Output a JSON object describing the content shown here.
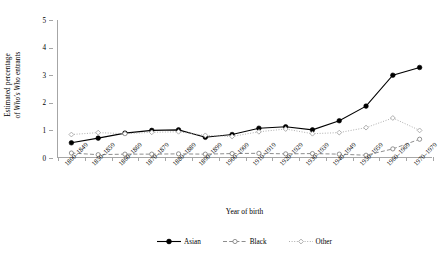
{
  "chart_data": {
    "type": "line",
    "title": "",
    "xlabel": "Year of birth",
    "ylabel_line1": "Estimated percentage",
    "ylabel_line2_pre": "of ",
    "ylabel_line2_italic1": "Who's Who",
    "ylabel_line2_mid": " entrants",
    "ylabel_plain": "Estimated percentage of Who's Who entrants",
    "categories": [
      "1800–1849",
      "1850–1859",
      "1860–1869",
      "1870–1879",
      "1880–1889",
      "1890–1899",
      "1900–1909",
      "1910–1919",
      "1920–1929",
      "1930–1939",
      "1940–1949",
      "1950–1959",
      "1960–1969",
      "1970–1979"
    ],
    "ylim": [
      0,
      5
    ],
    "yticks": [
      0,
      1,
      2,
      3,
      4,
      5
    ],
    "ytick_labels": [
      "0",
      "1",
      "2",
      "3",
      "4",
      "5"
    ],
    "grid": false,
    "legend_position": "bottom",
    "series": [
      {
        "name": "Asian",
        "color": "#000000",
        "line_style": "solid",
        "marker": "filled-circle",
        "values": [
          0.55,
          0.72,
          0.9,
          1.0,
          1.02,
          0.75,
          0.85,
          1.08,
          1.13,
          1.02,
          1.35,
          1.88,
          3.0,
          3.28
        ]
      },
      {
        "name": "Black",
        "color": "#808080",
        "line_style": "dashed",
        "marker": "open-circle",
        "values": [
          0.18,
          0.12,
          0.14,
          0.14,
          0.15,
          0.14,
          0.16,
          0.17,
          0.15,
          0.16,
          0.14,
          0.1,
          0.33,
          0.68
        ]
      },
      {
        "name": "Other",
        "color": "#a6a6a6",
        "line_style": "dotted",
        "marker": "open-diamond",
        "values": [
          0.85,
          0.92,
          0.88,
          0.93,
          0.95,
          0.82,
          0.78,
          0.95,
          1.05,
          0.88,
          0.92,
          1.1,
          1.45,
          1.0
        ]
      }
    ]
  },
  "legend": {
    "items": [
      {
        "label": "Asian"
      },
      {
        "label": "Black"
      },
      {
        "label": "Other"
      }
    ]
  },
  "colors": {
    "axis": "#a6a6a6",
    "asian": "#000000",
    "black": "#808080",
    "other": "#a6a6a6"
  }
}
